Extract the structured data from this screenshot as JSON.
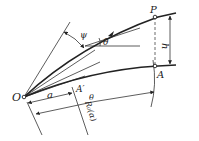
{
  "diagram": {
    "type": "geometric construction",
    "labels": {
      "origin": "O",
      "point_p": "P",
      "point_a": "A",
      "point_a_prime": "A′",
      "angle_psi": "ψ",
      "angle_theta_upper": "θ",
      "angle_theta_lower": "θ",
      "offset_h": "h",
      "dim_a": "a",
      "dim_r0": "R₀(α)"
    },
    "elements": [
      {
        "id": "O",
        "kind": "point",
        "label": "O"
      },
      {
        "id": "P",
        "kind": "point",
        "label": "P"
      },
      {
        "id": "A",
        "kind": "point",
        "label": "A"
      },
      {
        "id": "A_prime",
        "kind": "point",
        "label": "A′"
      },
      {
        "id": "curve_OP",
        "kind": "curve",
        "style": "thick"
      },
      {
        "id": "curve_OA",
        "kind": "curve",
        "style": "thick"
      },
      {
        "id": "line_PA",
        "kind": "line",
        "style": "dashed"
      },
      {
        "id": "dim_h",
        "kind": "dimension",
        "label": "h"
      },
      {
        "id": "dim_a",
        "kind": "dimension",
        "label": "a"
      },
      {
        "id": "dim_R0",
        "kind": "dimension",
        "label": "R₀(α)"
      },
      {
        "id": "angle_psi",
        "kind": "angle",
        "label": "ψ"
      },
      {
        "id": "angle_theta",
        "kind": "angle",
        "label": "θ"
      }
    ]
  }
}
